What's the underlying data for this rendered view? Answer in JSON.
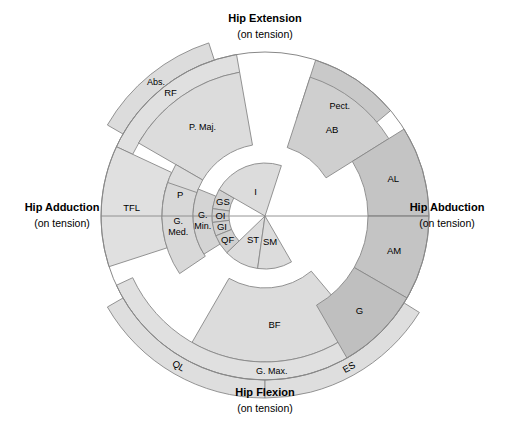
{
  "figure": {
    "type": "radial-sector-diagram",
    "background_color": "#ffffff",
    "center": {
      "x": 265,
      "y": 216
    },
    "stroke_color": "#888888",
    "axis_labels": {
      "top": {
        "title": "Hip Extension",
        "subtitle": "(on tension)"
      },
      "bottom": {
        "title": "Hip Flexion",
        "subtitle": "(on tension)"
      },
      "left": {
        "title": "Hip Adduction",
        "subtitle": "(on tension)"
      },
      "right": {
        "title": "Hip Abduction",
        "subtitle": "(on tension)"
      }
    },
    "ring_radii": [
      36,
      53,
      72,
      103,
      146,
      164
    ],
    "fills": {
      "light": "#e3e3e3",
      "mid": "#d8d8d8",
      "dark": "#c9c9c9",
      "darker": "#bfbfbf",
      "band": "#dedede"
    }
  },
  "segments": [
    {
      "id": "abs",
      "label": "Abs.",
      "ring": "outer-band",
      "a0": 108,
      "a1": 150,
      "fill": "#dcdcdc",
      "rotate": 0
    },
    {
      "id": "rf",
      "label": "RF",
      "ring": "r5",
      "a0": 100,
      "a1": 155,
      "fill": "#e0e0e0",
      "rotate": 0
    },
    {
      "id": "pmaj",
      "label": "P. Maj.",
      "ring": "r4",
      "a0": 100,
      "a1": 150,
      "fill": "#dcdcdc",
      "rotate": 0
    },
    {
      "id": "tfl",
      "label": "TFL",
      "ring": "r5",
      "a0": 155,
      "a1": 198,
      "fill": "#e0e0e0",
      "rotate": 0
    },
    {
      "id": "p",
      "label": "P",
      "ring": "r4",
      "a0": 150,
      "a1": 182,
      "fill": "#dcdcdc",
      "rotate": 0
    },
    {
      "id": "gmed",
      "label": "G. Med.",
      "ring": "r3",
      "a0": 161,
      "a1": 214,
      "fill": "#d8d8d8",
      "rotate": 0
    },
    {
      "id": "gmin",
      "label": "G. Min.",
      "ring": "r2",
      "a0": 158,
      "a1": 212,
      "fill": "#d4d4d4",
      "rotate": 0
    },
    {
      "id": "gs",
      "label": "GS",
      "ring": "r1",
      "a0": 150,
      "a1": 172,
      "fill": "#d0d0d0",
      "rotate": 0
    },
    {
      "id": "oi",
      "label": "OI",
      "ring": "r1",
      "a0": 172,
      "a1": 187,
      "fill": "#d0d0d0",
      "rotate": 0
    },
    {
      "id": "gi",
      "label": "GI",
      "ring": "r1",
      "a0": 187,
      "a1": 202,
      "fill": "#d0d0d0",
      "rotate": 0
    },
    {
      "id": "qf",
      "label": "QF",
      "ring": "r1",
      "a0": 202,
      "a1": 224,
      "fill": "#d0d0d0",
      "rotate": 0
    },
    {
      "id": "i",
      "label": "I",
      "ring": "r0",
      "a0": 72,
      "a1": 150,
      "fill": "#dcdcdc",
      "rotate": 0
    },
    {
      "id": "st",
      "label": "ST",
      "ring": "r0",
      "a0": 224,
      "a1": 262,
      "fill": "#dcdcdc",
      "rotate": 0
    },
    {
      "id": "sm",
      "label": "SM",
      "ring": "r0",
      "a0": 262,
      "a1": 300,
      "fill": "#dcdcdc",
      "rotate": 0
    },
    {
      "id": "bf",
      "label": "BF",
      "ring": "r4",
      "a0": 240,
      "a1": 310,
      "fill": "#dcdcdc",
      "rotate": 0
    },
    {
      "id": "gmax",
      "label": "G. Max.",
      "ring": "r5",
      "a0": 205,
      "a1": 340,
      "fill": "#e0e0e0",
      "rotate": 0
    },
    {
      "id": "ql",
      "label": "QL",
      "ring": "outer-band",
      "a0": 210,
      "a1": 270,
      "fill": "#dedede",
      "rotate": 1
    },
    {
      "id": "es",
      "label": "ES",
      "ring": "outer-band",
      "a0": 270,
      "a1": 328,
      "fill": "#dedede",
      "rotate": 1
    },
    {
      "id": "pect",
      "label": "Pect.",
      "ring": "r5",
      "a0": 40,
      "a1": 72,
      "fill": "#c9c9c9",
      "rotate": 0
    },
    {
      "id": "ab",
      "label": "AB",
      "ring": "r4",
      "a0": 32,
      "a1": 72,
      "fill": "#cfcfcf",
      "rotate": 0
    },
    {
      "id": "al",
      "label": "AL",
      "ring": "r5",
      "a0": 0,
      "a1": 32,
      "fill": "#c4c4c4",
      "rotate": 0
    },
    {
      "id": "am",
      "label": "AM",
      "ring": "r5",
      "a0": 330,
      "a1": 360,
      "fill": "#c4c4c4",
      "rotate": 0
    },
    {
      "id": "g",
      "label": "G",
      "ring": "r5",
      "a0": 300,
      "a1": 330,
      "fill": "#bfbfbf",
      "rotate": 0
    }
  ],
  "chart_data": {
    "type": "pie",
    "categories": [
      "Abs.",
      "RF",
      "P. Maj.",
      "TFL",
      "P",
      "G. Med.",
      "G. Min.",
      "GS",
      "OI",
      "GI",
      "QF",
      "I",
      "ST",
      "SM",
      "BF",
      "G. Max.",
      "QL",
      "ES",
      "Pect.",
      "AB",
      "AL",
      "AM",
      "G"
    ],
    "values": [
      42,
      55,
      50,
      43,
      32,
      53,
      54,
      22,
      15,
      15,
      22,
      78,
      38,
      38,
      70,
      135,
      60,
      58,
      32,
      40,
      32,
      30,
      30
    ],
    "xlabel": "Hip Adduction / Hip Abduction",
    "ylabel": "Hip Extension / Hip Flexion",
    "legend_position": "none",
    "grid": false
  }
}
